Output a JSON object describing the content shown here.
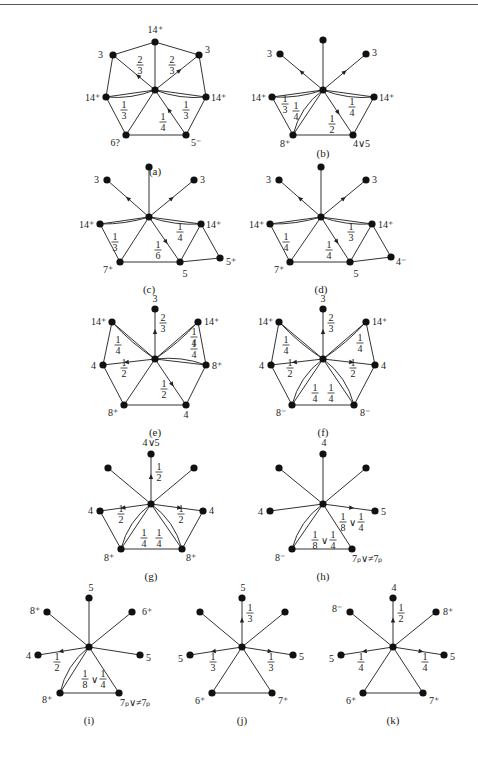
{
  "caption": "图 2.26　情况 5 证明过程示意图",
  "panels": [
    {
      "id": "a",
      "label": "(a)",
      "vertices": [
        {
          "name": "center",
          "x": 150,
          "y": 90
        },
        {
          "name": "top",
          "x": 150,
          "y": 42,
          "label": "14⁺"
        },
        {
          "name": "ul",
          "x": 113,
          "y": 55,
          "label": "3"
        },
        {
          "name": "ur",
          "x": 200,
          "y": 55,
          "label": "3"
        },
        {
          "name": "l",
          "x": 106,
          "y": 97,
          "label": "14⁺"
        },
        {
          "name": "r",
          "x": 207,
          "y": 97,
          "label": "14⁺"
        },
        {
          "name": "bl",
          "x": 126,
          "y": 135,
          "label": "6?"
        },
        {
          "name": "br",
          "x": 186,
          "y": 135,
          "label": "5⁻"
        }
      ],
      "weights": [
        "2/3",
        "2/3",
        "1/3",
        "1/4",
        "1/3"
      ]
    },
    {
      "id": "b",
      "label": "(b)",
      "vertices": [
        {
          "name": "center",
          "x": 323,
          "y": 90,
          "label": ""
        },
        {
          "name": "top",
          "x": 323,
          "y": 40
        },
        {
          "name": "ul",
          "x": 280,
          "y": 54,
          "label": "3"
        },
        {
          "name": "ur",
          "x": 367,
          "y": 54,
          "label": "3"
        },
        {
          "name": "l",
          "x": 272,
          "y": 97,
          "label": "14⁺"
        },
        {
          "name": "r",
          "x": 374,
          "y": 97,
          "label": "14⁺"
        },
        {
          "name": "bl",
          "x": 293,
          "y": 135,
          "label": "8⁺"
        },
        {
          "name": "br",
          "x": 353,
          "y": 135,
          "label": "4∨5"
        }
      ],
      "weights": [
        "1/3",
        "1/4",
        "1/2",
        "1/4"
      ]
    },
    {
      "id": "c",
      "label": "(c)",
      "vertices": [
        {
          "name": "l",
          "label": "14⁺"
        },
        {
          "name": "r",
          "label": "14⁺"
        },
        {
          "name": "ul",
          "label": "3"
        },
        {
          "name": "ur",
          "label": "3"
        },
        {
          "name": "bl",
          "label": "7⁺"
        },
        {
          "name": "bm",
          "label": "5"
        },
        {
          "name": "br",
          "label": "5⁺"
        }
      ],
      "weights": [
        "1/3",
        "1/6",
        "1/4"
      ]
    },
    {
      "id": "d",
      "label": "(d)",
      "vertices": [
        {
          "name": "l",
          "label": "14⁺"
        },
        {
          "name": "r",
          "label": "14⁺"
        },
        {
          "name": "ul",
          "label": "3"
        },
        {
          "name": "ur",
          "label": "3"
        },
        {
          "name": "bl",
          "label": "7⁺"
        },
        {
          "name": "bm",
          "label": "5"
        },
        {
          "name": "br",
          "label": "4⁻"
        }
      ],
      "weights": [
        "1/4",
        "1/4",
        "1/3"
      ]
    },
    {
      "id": "e",
      "label": "(e)",
      "vertices": [
        {
          "name": "top",
          "label": "3"
        },
        {
          "name": "ul",
          "label": "14⁺"
        },
        {
          "name": "ur",
          "label": "14⁺"
        },
        {
          "name": "l",
          "label": "4"
        },
        {
          "name": "r",
          "label": "8⁺"
        },
        {
          "name": "bl",
          "label": "8⁺"
        },
        {
          "name": "br",
          "label": "4"
        }
      ],
      "weights": [
        "2/3",
        "1/4",
        "1/4",
        "1/4",
        "1/2",
        "1/2"
      ]
    },
    {
      "id": "f",
      "label": "(f)",
      "vertices": [
        {
          "name": "top",
          "label": "3"
        },
        {
          "name": "ul",
          "label": "14⁺"
        },
        {
          "name": "ur",
          "label": "14⁺"
        },
        {
          "name": "l",
          "label": "4"
        },
        {
          "name": "r",
          "label": "4"
        },
        {
          "name": "bl",
          "label": "8⁻"
        },
        {
          "name": "br",
          "label": "8⁻"
        }
      ],
      "weights": [
        "2/3",
        "1/4",
        "1/4",
        "1/2",
        "1/2",
        "1/4",
        "1/4"
      ]
    },
    {
      "id": "g",
      "label": "(g)",
      "vertices": [
        {
          "name": "top",
          "label": "4∨5"
        },
        {
          "name": "l",
          "label": "4"
        },
        {
          "name": "r",
          "label": "4"
        },
        {
          "name": "bl",
          "label": "8⁺"
        },
        {
          "name": "br",
          "label": "8⁺"
        }
      ],
      "weights": [
        "1/2",
        "1/2",
        "1/2",
        "1/4",
        "1/4"
      ]
    },
    {
      "id": "h",
      "label": "(h)",
      "vertices": [
        {
          "name": "top",
          "label": "4"
        },
        {
          "name": "l",
          "label": "4"
        },
        {
          "name": "r",
          "label": "5"
        },
        {
          "name": "bl",
          "label": "8⁻"
        },
        {
          "name": "br",
          "label": "7ₚ∨≠7ₚ"
        }
      ],
      "weights": [
        "1/8∨1/4",
        "1/8∨1/4"
      ]
    },
    {
      "id": "i",
      "label": "(i)",
      "vertices": [
        {
          "name": "top",
          "label": "5"
        },
        {
          "name": "ul",
          "label": "8⁺"
        },
        {
          "name": "ur",
          "label": "6⁺"
        },
        {
          "name": "l",
          "label": "4"
        },
        {
          "name": "r",
          "label": "5"
        },
        {
          "name": "bl",
          "label": "8⁺"
        },
        {
          "name": "br",
          "label": "7ₚ∨≠7ₚ"
        }
      ],
      "weights": [
        "1/2",
        "1/8∨1/4"
      ]
    },
    {
      "id": "j",
      "label": "(j)",
      "vertices": [
        {
          "name": "top",
          "label": "5"
        },
        {
          "name": "l",
          "label": "5"
        },
        {
          "name": "r",
          "label": "5"
        },
        {
          "name": "bl",
          "label": "6⁺"
        },
        {
          "name": "br",
          "label": "7⁺"
        }
      ],
      "weights": [
        "1/3",
        "1/3",
        "1/3"
      ]
    },
    {
      "id": "k",
      "label": "(k)",
      "vertices": [
        {
          "name": "top",
          "label": "4"
        },
        {
          "name": "ul",
          "label": "8⁻"
        },
        {
          "name": "ur",
          "label": "8⁺"
        },
        {
          "name": "l",
          "label": "5"
        },
        {
          "name": "r",
          "label": "5"
        },
        {
          "name": "bl",
          "label": "6⁺"
        },
        {
          "name": "br",
          "label": "7⁺"
        }
      ],
      "weights": [
        "1/2",
        "1/4",
        "1/4"
      ]
    }
  ]
}
